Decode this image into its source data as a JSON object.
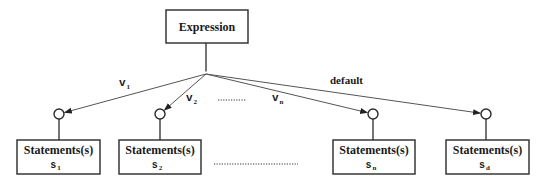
{
  "colors": {
    "stroke": "#2a2a2a",
    "text": "#1a1a1a",
    "background": "#ffffff",
    "arrow_line": "#555555"
  },
  "expression": {
    "label": "Expression",
    "x": 166,
    "y": 10,
    "w": 82,
    "h": 33
  },
  "junction": {
    "x": 206,
    "y": 74,
    "r": 2.5
  },
  "branches": [
    {
      "id": "s1",
      "edge_label": "v",
      "edge_label_index": "1",
      "edge_label_pos": {
        "x": 119,
        "y": 86
      },
      "circle": {
        "x": 59,
        "y": 114,
        "r": 5
      },
      "box": {
        "x": 17,
        "y": 140,
        "w": 83,
        "h": 34
      },
      "title": "Statements(s)",
      "sub": "s",
      "sub_index": "1"
    },
    {
      "id": "s2",
      "edge_label": "v",
      "edge_label_index": "2",
      "edge_label_pos": {
        "x": 186,
        "y": 101
      },
      "circle": {
        "x": 160,
        "y": 114,
        "r": 5
      },
      "box": {
        "x": 119,
        "y": 140,
        "w": 82,
        "h": 34
      },
      "title": "Statements(s)",
      "sub": "s",
      "sub_index": "2"
    },
    {
      "id": "sn",
      "edge_label": "v",
      "edge_label_index": "n",
      "edge_label_pos": {
        "x": 272,
        "y": 101
      },
      "circle": {
        "x": 373,
        "y": 114,
        "r": 5
      },
      "box": {
        "x": 333,
        "y": 140,
        "w": 82,
        "h": 34
      },
      "title": "Statements(s)",
      "sub": "s",
      "sub_index": "n"
    },
    {
      "id": "sd",
      "edge_label": "default",
      "edge_label_index": "",
      "edge_label_pos": {
        "x": 330,
        "y": 84
      },
      "circle": {
        "x": 486,
        "y": 114,
        "r": 5
      },
      "box": {
        "x": 446,
        "y": 140,
        "w": 83,
        "h": 34
      },
      "title": "Statements(s)",
      "sub": "s",
      "sub_index": "d"
    }
  ],
  "ellipses": [
    {
      "x1": 218,
      "y1": 100,
      "x2": 246,
      "y2": 100,
      "label": "upper-ellipsis"
    },
    {
      "x1": 214,
      "y1": 164,
      "x2": 298,
      "y2": 164,
      "label": "lower-ellipsis"
    }
  ]
}
